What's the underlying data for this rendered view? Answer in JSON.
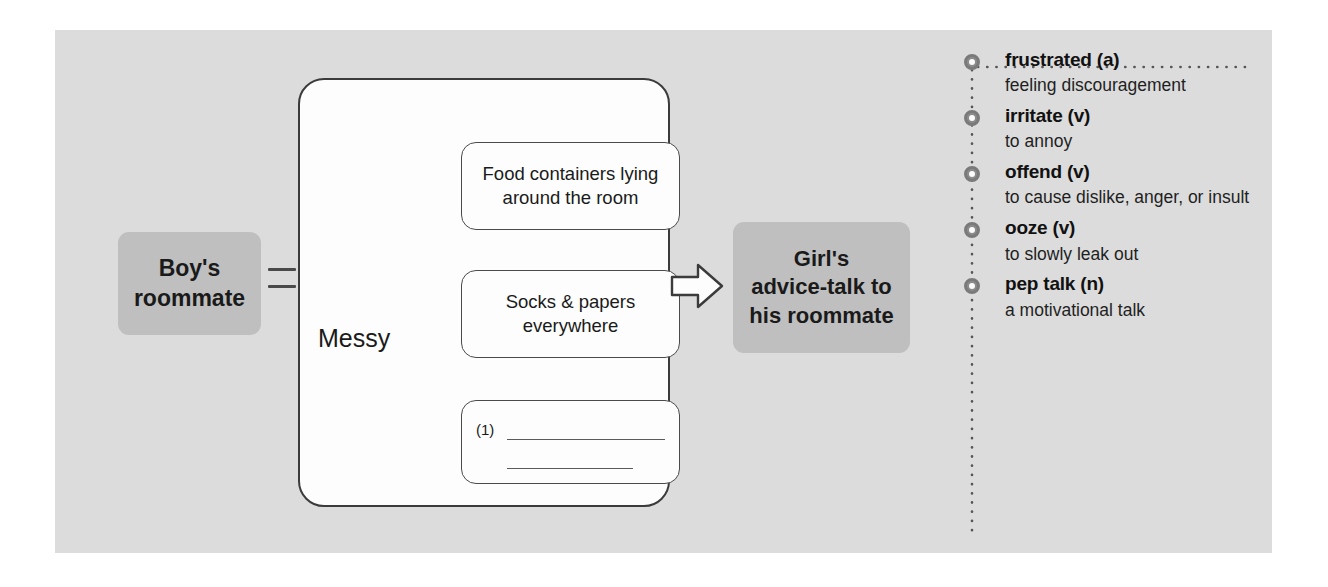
{
  "panel": {
    "background_color": "#dcdcdc"
  },
  "flowchart": {
    "topic_box": {
      "label_lines": [
        "Boy's",
        "roommate"
      ],
      "background_color": "#bfbfbf"
    },
    "connector": {
      "symbol": "equals"
    },
    "trait_label": "Messy",
    "detail_boxes": [
      {
        "text_lines": [
          "Food containers lying",
          "around the room"
        ]
      },
      {
        "text_lines": [
          "Socks & papers",
          "everywhere"
        ]
      }
    ],
    "blank_box": {
      "number": "(1)",
      "rule_count": 2
    },
    "arrow": {
      "icon": "right-block-arrow"
    },
    "result_box": {
      "label_lines": [
        "Girl's",
        "advice-talk to",
        "his roommate"
      ],
      "background_color": "#bfbfbf"
    }
  },
  "vocabulary": {
    "items": [
      {
        "word": "frustrated (a)",
        "definition": "feeling discouragement"
      },
      {
        "word": "irritate (v)",
        "definition": "to annoy"
      },
      {
        "word": "offend (v)",
        "definition": "to cause dislike, anger, or insult"
      },
      {
        "word": "ooze (v)",
        "definition": "to slowly leak out"
      },
      {
        "word": "pep talk (n)",
        "definition": "a motivational talk"
      }
    ]
  }
}
